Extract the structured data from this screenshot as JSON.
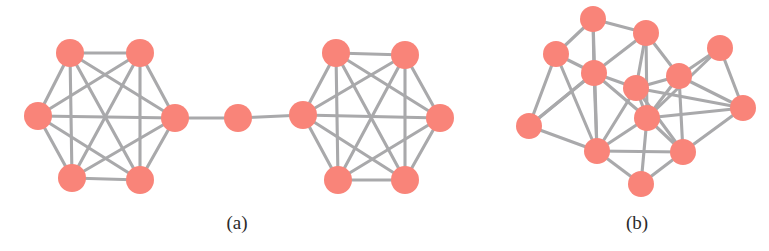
{
  "figure": {
    "width": 769,
    "height": 251,
    "background_color": "#ffffff",
    "node_color": "#f98479",
    "edge_color": "#a9a9ab",
    "caption_color": "#2b2b2b"
  },
  "panels": [
    {
      "id": "panel-a",
      "caption": "(a)",
      "caption_x": 237,
      "caption_y": 228,
      "description": "Two complete graphs (K6 cliques) joined through a single bridge node",
      "node_radius": 14,
      "edge_width": 3.1
    },
    {
      "id": "panel-b",
      "caption": "(b)",
      "caption_x": 637,
      "caption_y": 228,
      "description": "A single dense random network of 13 nodes",
      "node_radius": 13,
      "edge_width": 3.1
    }
  ],
  "chart_data": {
    "type": "graph",
    "title": "",
    "graphs": [
      {
        "panel": "a",
        "label": "(a)",
        "node_count": 13,
        "edge_count": 32,
        "layout": "two-cliques-with-bridge",
        "nodes": [
          {
            "id": 0,
            "x": 70,
            "y": 53,
            "group": "left-clique"
          },
          {
            "id": 1,
            "x": 140,
            "y": 53,
            "group": "left-clique"
          },
          {
            "id": 2,
            "x": 38,
            "y": 116,
            "group": "left-clique"
          },
          {
            "id": 3,
            "x": 175,
            "y": 118,
            "group": "left-clique"
          },
          {
            "id": 4,
            "x": 72,
            "y": 178,
            "group": "left-clique"
          },
          {
            "id": 5,
            "x": 140,
            "y": 180,
            "group": "left-clique"
          },
          {
            "id": 6,
            "x": 238,
            "y": 118,
            "group": "bridge"
          },
          {
            "id": 7,
            "x": 303,
            "y": 115,
            "group": "right-clique"
          },
          {
            "id": 8,
            "x": 336,
            "y": 53,
            "group": "right-clique"
          },
          {
            "id": 9,
            "x": 405,
            "y": 55,
            "group": "right-clique"
          },
          {
            "id": 10,
            "x": 440,
            "y": 118,
            "group": "right-clique"
          },
          {
            "id": 11,
            "x": 338,
            "y": 180,
            "group": "right-clique"
          },
          {
            "id": 12,
            "x": 405,
            "y": 180,
            "group": "right-clique"
          }
        ],
        "edges": [
          [
            0,
            1
          ],
          [
            0,
            2
          ],
          [
            0,
            3
          ],
          [
            0,
            4
          ],
          [
            0,
            5
          ],
          [
            1,
            2
          ],
          [
            1,
            3
          ],
          [
            1,
            4
          ],
          [
            1,
            5
          ],
          [
            2,
            3
          ],
          [
            2,
            4
          ],
          [
            2,
            5
          ],
          [
            3,
            4
          ],
          [
            3,
            5
          ],
          [
            4,
            5
          ],
          [
            3,
            6
          ],
          [
            6,
            7
          ],
          [
            7,
            8
          ],
          [
            7,
            9
          ],
          [
            7,
            10
          ],
          [
            7,
            11
          ],
          [
            7,
            12
          ],
          [
            8,
            9
          ],
          [
            8,
            10
          ],
          [
            8,
            11
          ],
          [
            8,
            12
          ],
          [
            9,
            10
          ],
          [
            9,
            11
          ],
          [
            9,
            12
          ],
          [
            10,
            11
          ],
          [
            10,
            12
          ],
          [
            11,
            12
          ]
        ]
      },
      {
        "panel": "b",
        "label": "(b)",
        "node_count": 13,
        "edge_count": 34,
        "layout": "dense-random",
        "nodes": [
          {
            "id": 0,
            "x": 593,
            "y": 19
          },
          {
            "id": 1,
            "x": 646,
            "y": 33
          },
          {
            "id": 2,
            "x": 556,
            "y": 54
          },
          {
            "id": 3,
            "x": 594,
            "y": 73
          },
          {
            "id": 4,
            "x": 636,
            "y": 88
          },
          {
            "id": 5,
            "x": 679,
            "y": 76
          },
          {
            "id": 6,
            "x": 720,
            "y": 48
          },
          {
            "id": 7,
            "x": 529,
            "y": 126
          },
          {
            "id": 8,
            "x": 647,
            "y": 118
          },
          {
            "id": 9,
            "x": 743,
            "y": 108
          },
          {
            "id": 10,
            "x": 597,
            "y": 151
          },
          {
            "id": 11,
            "x": 683,
            "y": 152
          },
          {
            "id": 12,
            "x": 641,
            "y": 184
          }
        ],
        "edges": [
          [
            0,
            2
          ],
          [
            0,
            1
          ],
          [
            0,
            3
          ],
          [
            0,
            10
          ],
          [
            1,
            3
          ],
          [
            1,
            4
          ],
          [
            1,
            5
          ],
          [
            1,
            8
          ],
          [
            2,
            3
          ],
          [
            2,
            7
          ],
          [
            2,
            10
          ],
          [
            3,
            4
          ],
          [
            3,
            7
          ],
          [
            3,
            10
          ],
          [
            3,
            8
          ],
          [
            4,
            5
          ],
          [
            4,
            8
          ],
          [
            4,
            10
          ],
          [
            4,
            11
          ],
          [
            4,
            9
          ],
          [
            5,
            6
          ],
          [
            5,
            8
          ],
          [
            5,
            9
          ],
          [
            5,
            11
          ],
          [
            6,
            9
          ],
          [
            6,
            8
          ],
          [
            7,
            10
          ],
          [
            7,
            3
          ],
          [
            8,
            10
          ],
          [
            8,
            11
          ],
          [
            8,
            12
          ],
          [
            8,
            9
          ],
          [
            9,
            11
          ],
          [
            10,
            11
          ],
          [
            10,
            12
          ],
          [
            11,
            12
          ]
        ]
      }
    ]
  }
}
